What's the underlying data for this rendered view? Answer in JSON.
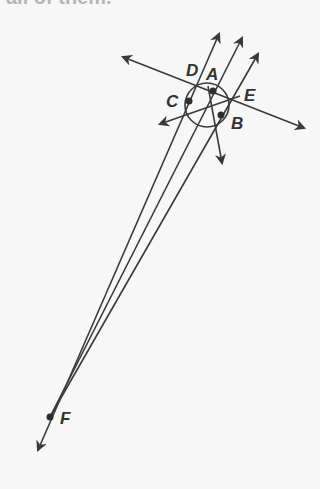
{
  "header": {
    "text": "all of them."
  },
  "diagram": {
    "stroke_color": "#3a3a3a",
    "background": "#f7f7f7",
    "points": {
      "A": {
        "label": "A",
        "x": 213,
        "y": 91
      },
      "B": {
        "label": "B",
        "x": 222,
        "y": 114
      },
      "C": {
        "label": "C",
        "x": 190,
        "y": 100
      },
      "D": {
        "label": "D",
        "x": 196,
        "y": 89
      },
      "E": {
        "label": "E",
        "x": 233,
        "y": 98
      },
      "F": {
        "label": "F",
        "x": 50,
        "y": 417
      }
    },
    "circle": {
      "cx": 207,
      "cy": 105,
      "r": 22
    },
    "labels": {
      "A": "A",
      "B": "B",
      "C": "C",
      "D": "D",
      "E": "E",
      "F": "F"
    }
  }
}
